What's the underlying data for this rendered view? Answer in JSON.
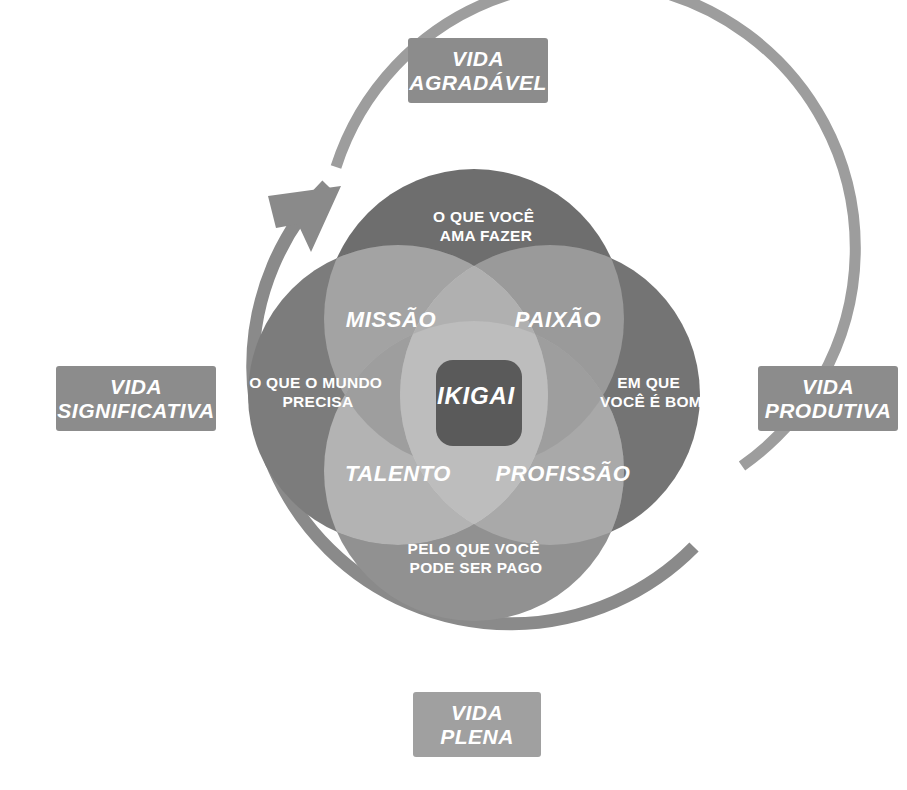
{
  "diagram": {
    "title": "Ikigai",
    "type": "venn-4-circle",
    "center": {
      "x": 474,
      "y": 395
    },
    "circle_radius": 150,
    "circle_offset": 76,
    "outer_labels": [
      {
        "id": "agradavel",
        "lines": [
          "VIDA",
          "AGRADÁVEL"
        ],
        "position": "top"
      },
      {
        "id": "produtiva",
        "lines": [
          "VIDA",
          "PRODUTIVA"
        ],
        "position": "right"
      },
      {
        "id": "significativa",
        "lines": [
          "VIDA",
          "SIGNIFICATIVA"
        ],
        "position": "left"
      },
      {
        "id": "plena",
        "lines": [
          "VIDA",
          "PLENA"
        ],
        "position": "bottom"
      }
    ],
    "circles": [
      {
        "id": "ama-fazer",
        "lines": [
          "O QUE VOCÊ",
          "AMA FAZER"
        ],
        "position": "top",
        "tx": 486,
        "ty": 222
      },
      {
        "id": "e-bom",
        "lines": [
          "EM QUE",
          "VOCÊ É BOM"
        ],
        "position": "right",
        "tx": 651,
        "ty": 388
      },
      {
        "id": "ser-pago",
        "lines": [
          "PELO QUE VOCÊ",
          "PODE SER PAGO"
        ],
        "position": "bottom",
        "tx": 476,
        "ty": 554
      },
      {
        "id": "mundo-precisa",
        "lines": [
          "O QUE O MUNDO",
          "PRECISA"
        ],
        "position": "left",
        "tx": 318,
        "ty": 388
      }
    ],
    "intersections": [
      {
        "id": "missao",
        "label": "MISSÃO",
        "tx": 391,
        "ty": 327
      },
      {
        "id": "paixao",
        "label": "PAIXÃO",
        "tx": 558,
        "ty": 327
      },
      {
        "id": "talento",
        "label": "TALENTO",
        "tx": 398,
        "ty": 481
      },
      {
        "id": "profissao",
        "label": "PROFISSÃO",
        "tx": 563,
        "ty": 481
      }
    ],
    "core": {
      "id": "ikigai",
      "label": "IKIGAI",
      "tx": 476,
      "ty": 404
    },
    "arcs": [
      {
        "id": "inner-arrow-arc",
        "has_arrowhead": true,
        "radius": 231,
        "stroke": 13
      },
      {
        "id": "outer-arc",
        "has_arrowhead": false,
        "radius": 266,
        "stroke": 11
      }
    ]
  },
  "colors": {
    "label_box": "#8c8c8c",
    "circle_base": "#7f7f7f",
    "circle_dark": "#6b6b6b",
    "overlap_light": "#a8a8a8",
    "overlap_pale": "#d2d2d2",
    "core": "#5a5a5a",
    "arc_inner": "#8a8a8a",
    "arc_outer": "#9d9d9d",
    "text": "#ffffff",
    "background": "#ffffff"
  }
}
